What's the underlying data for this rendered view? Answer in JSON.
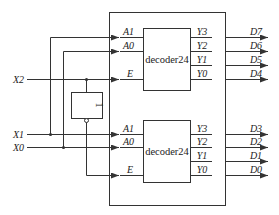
{
  "diagram": {
    "type": "circuit",
    "inputs": [
      "X2",
      "X1",
      "X0"
    ],
    "outputs": [
      "D7",
      "D6",
      "D5",
      "D4",
      "D3",
      "D2",
      "D1",
      "D0"
    ],
    "not_gate": {
      "label": "1"
    },
    "decoders": [
      {
        "id": "upper",
        "name": "decoder24",
        "inputs": [
          "A1",
          "A0",
          "E"
        ],
        "outputs": [
          "Y3",
          "Y2",
          "Y1",
          "Y0"
        ],
        "output_nets": [
          "D7",
          "D6",
          "D5",
          "D4"
        ],
        "enable_source": "X2"
      },
      {
        "id": "lower",
        "name": "decoder24",
        "inputs": [
          "A1",
          "A0",
          "E"
        ],
        "outputs": [
          "Y3",
          "Y2",
          "Y1",
          "Y0"
        ],
        "output_nets": [
          "D3",
          "D2",
          "D1",
          "D0"
        ],
        "enable_source": "NOT X2"
      }
    ],
    "colors": {
      "line": "#333333",
      "background": "#ffffff"
    }
  }
}
